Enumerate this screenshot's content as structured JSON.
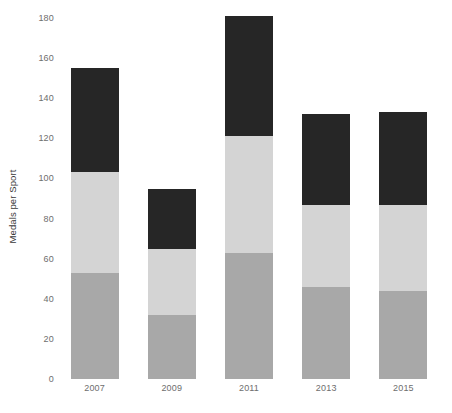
{
  "chart_data": {
    "type": "bar",
    "subtype": "stacked-bar",
    "title": "",
    "xlabel": "",
    "ylabel": "Medals per Sport",
    "categories": [
      "2007",
      "2009",
      "2011",
      "2013",
      "2015"
    ],
    "series": [
      {
        "name": "series-bottom",
        "color": "#a8a8a8",
        "values": [
          53,
          32,
          63,
          46,
          44
        ]
      },
      {
        "name": "series-middle",
        "color": "#d4d4d4",
        "values": [
          50,
          33,
          58,
          41,
          43
        ]
      },
      {
        "name": "series-top",
        "color": "#262626",
        "values": [
          52,
          30,
          60,
          45,
          46
        ]
      }
    ],
    "totals": [
      155,
      95,
      181,
      132,
      133
    ],
    "ylim": [
      0,
      180
    ],
    "yticks": [
      0,
      20,
      40,
      60,
      80,
      100,
      120,
      140,
      160,
      180
    ],
    "ytick_labels": [
      "0",
      "20",
      "40",
      "60",
      "80",
      "100",
      "120",
      "140",
      "160",
      "180"
    ],
    "grid": false,
    "legend": "none",
    "axis_line_color": "#6e6e6e",
    "background": "#ffffff"
  }
}
